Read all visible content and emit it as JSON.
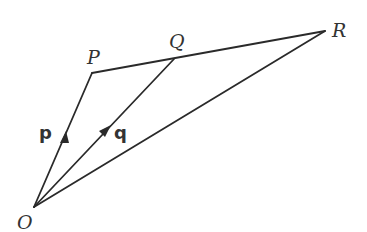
{
  "diagram": {
    "type": "vector-geometry",
    "points": {
      "O": {
        "label": "O",
        "x": 34,
        "y": 207
      },
      "P": {
        "label": "P",
        "x": 92,
        "y": 73
      },
      "Q": {
        "label": "Q",
        "x": 174,
        "y": 59
      },
      "R": {
        "label": "R",
        "x": 325,
        "y": 31
      }
    },
    "segments": [
      {
        "from": "O",
        "to": "P",
        "arrow": true,
        "vector_label": "p"
      },
      {
        "from": "O",
        "to": "Q",
        "arrow": true,
        "vector_label": "q"
      },
      {
        "from": "O",
        "to": "R",
        "arrow": false
      },
      {
        "from": "P",
        "to": "R",
        "arrow": false
      }
    ],
    "labels": {
      "O": "O",
      "P": "P",
      "Q": "Q",
      "R": "R",
      "p": "p",
      "q": "q"
    },
    "colors": {
      "line": "#2a2a2a",
      "text": "#333333",
      "background": "#ffffff"
    }
  }
}
